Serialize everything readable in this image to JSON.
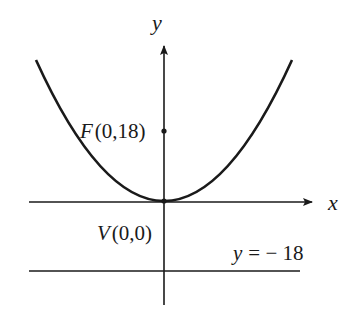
{
  "diagram": {
    "title": "",
    "axes": {
      "x_label": "x",
      "y_label": "y"
    },
    "curve": {
      "type": "parabola",
      "equation": "x^2 = 72y",
      "opens": "up"
    },
    "points": [
      {
        "name": "F",
        "label_prefix": "F",
        "coords": "(0,18)",
        "role": "focus"
      },
      {
        "name": "V",
        "label_prefix": "V",
        "coords": "(0,0)",
        "role": "vertex"
      }
    ],
    "directrix": {
      "label_lhs": "y",
      "label_rhs": "= − 18"
    },
    "colors": {
      "ink": "#1a1a1a",
      "background": "#ffffff"
    }
  }
}
